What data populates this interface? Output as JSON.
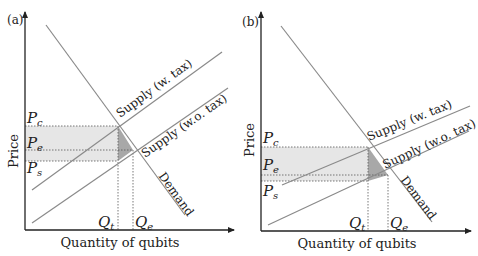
{
  "panels": [
    {
      "id": "a",
      "panel_label": "(a)",
      "y_axis_label": "Price",
      "x_axis_label": "Quantity of qubits",
      "curves": {
        "supply_with_tax": "Supply (w. tax)",
        "supply_without_tax": "Supply (w.o. tax)",
        "demand": "Demand"
      },
      "price_labels": {
        "Pc": "P",
        "Pc_sub": "c",
        "Pe": "P",
        "Pe_sub": "e",
        "Ps": "P",
        "Ps_sub": "s"
      },
      "quantity_labels": {
        "Qt": "Q",
        "Qt_sub": "t",
        "Qe": "Q",
        "Qe_sub": "e"
      }
    },
    {
      "id": "b",
      "panel_label": "(b)",
      "y_axis_label": "Price",
      "x_axis_label": "Quantity of qubits",
      "curves": {
        "supply_with_tax": "Supply (w. tax)",
        "supply_without_tax": "Supply (w.o. tax)",
        "demand": "Demand"
      },
      "price_labels": {
        "Pc": "P",
        "Pc_sub": "c",
        "Pe": "P",
        "Pe_sub": "e",
        "Ps": "P",
        "Ps_sub": "s"
      },
      "quantity_labels": {
        "Qt": "Q",
        "Qt_sub": "t",
        "Qe": "Q",
        "Qe_sub": "e"
      }
    }
  ],
  "colors": {
    "axis": "#222222",
    "curve": "#8a8a8a",
    "tax_revenue_fill": "#e6e6e6",
    "deadweight_fill": "#a8a8a8",
    "guide": "#555555"
  }
}
